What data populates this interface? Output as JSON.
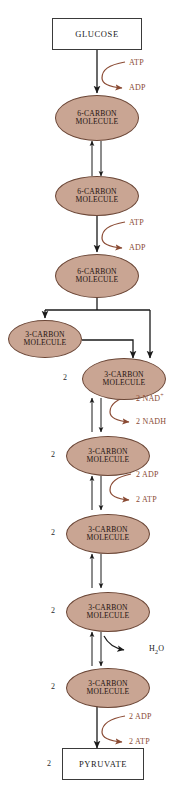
{
  "diagram": {
    "colors": {
      "ellipse_fill": "#c9a593",
      "ellipse_stroke": "#6b4636",
      "box_stroke": "#3a3a3a",
      "arrow_black": "#1a1a1a",
      "arrow_brown": "#8a4a33",
      "cofactor_text": "#8a4a33",
      "background": "#ffffff"
    },
    "nodes": [
      {
        "id": "glucose",
        "shape": "box",
        "label": "GLUCOSE",
        "lines": [
          "GLUCOSE"
        ],
        "stoich": ""
      },
      {
        "id": "c6a",
        "shape": "ellipse",
        "label": "6-CARBON MOLECULE",
        "lines": [
          "6-CARBON",
          "MOLECULE"
        ],
        "stoich": ""
      },
      {
        "id": "c6b",
        "shape": "ellipse",
        "label": "6-CARBON MOLECULE",
        "lines": [
          "6-CARBON",
          "MOLECULE"
        ],
        "stoich": ""
      },
      {
        "id": "c6c",
        "shape": "ellipse",
        "label": "6-CARBON MOLECULE",
        "lines": [
          "6-CARBON",
          "MOLECULE"
        ],
        "stoich": ""
      },
      {
        "id": "c3left",
        "shape": "ellipse",
        "label": "3-CARBON MOLECULE",
        "lines": [
          "3-CARBON",
          "MOLECULE"
        ],
        "stoich": ""
      },
      {
        "id": "c3a",
        "shape": "ellipse",
        "label": "3-CARBON MOLECULE",
        "lines": [
          "3-CARBON",
          "MOLECULE"
        ],
        "stoich": "2"
      },
      {
        "id": "c3b",
        "shape": "ellipse",
        "label": "3-CARBON MOLECULE",
        "lines": [
          "3-CARBON",
          "MOLECULE"
        ],
        "stoich": "2"
      },
      {
        "id": "c3c",
        "shape": "ellipse",
        "label": "3-CARBON MOLECULE",
        "lines": [
          "3-CARBON",
          "MOLECULE"
        ],
        "stoich": "2"
      },
      {
        "id": "c3d",
        "shape": "ellipse",
        "label": "3-CARBON MOLECULE",
        "lines": [
          "3-CARBON",
          "MOLECULE"
        ],
        "stoich": "2"
      },
      {
        "id": "c3e",
        "shape": "ellipse",
        "label": "3-CARBON MOLECULE",
        "lines": [
          "3-CARBON",
          "MOLECULE"
        ],
        "stoich": "2"
      },
      {
        "id": "pyruvate",
        "shape": "box",
        "label": "PYRUVATE",
        "lines": [
          "PYRUVATE"
        ],
        "stoich": "2"
      }
    ],
    "cofactors": [
      {
        "id": "atp1",
        "text": "ATP",
        "role": "reactant",
        "color": "brown"
      },
      {
        "id": "adp1",
        "text": "ADP",
        "role": "product",
        "color": "brown"
      },
      {
        "id": "atp2",
        "text": "ATP",
        "role": "reactant",
        "color": "brown"
      },
      {
        "id": "adp2",
        "text": "ADP",
        "role": "product",
        "color": "brown"
      },
      {
        "id": "nad",
        "text": "2 NAD",
        "sup": "+",
        "role": "reactant",
        "color": "brown"
      },
      {
        "id": "nadh",
        "text": "2 NADH",
        "role": "product",
        "color": "brown"
      },
      {
        "id": "adp3",
        "text": "2 ADP",
        "role": "reactant",
        "color": "brown"
      },
      {
        "id": "atp3",
        "text": "2 ATP",
        "role": "product",
        "color": "brown"
      },
      {
        "id": "water",
        "text": "H",
        "sub": "2",
        "tail": "O",
        "role": "product",
        "color": "black"
      },
      {
        "id": "adp4",
        "text": "2 ADP",
        "role": "reactant",
        "color": "brown"
      },
      {
        "id": "atp4",
        "text": "2 ATP",
        "role": "product",
        "color": "brown"
      }
    ]
  }
}
